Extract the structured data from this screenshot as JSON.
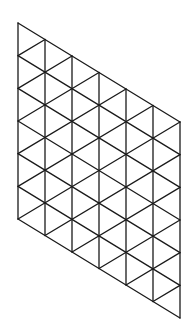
{
  "diagram": {
    "type": "triangular-grid-rhombus",
    "columns": 6,
    "rows": 6,
    "stroke_color": "#1a1a1a",
    "background": "#ffffff",
    "corners": {
      "top_left": [
        18,
        23
      ],
      "bottom_left": [
        18,
        219
      ],
      "top_right": [
        180,
        122
      ],
      "bottom_right": [
        180,
        317
      ]
    },
    "column_width": 27,
    "row_height": 32.67,
    "column_drop": 16.5
  }
}
